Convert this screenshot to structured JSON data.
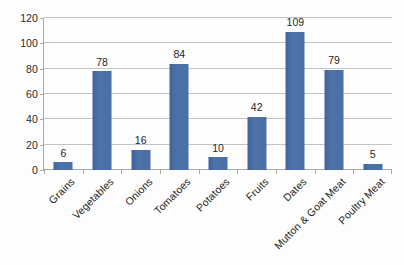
{
  "chart_data": {
    "type": "bar",
    "title": "",
    "subtitle": "",
    "xlabel": "",
    "ylabel": "",
    "categories": [
      "Grains",
      "Vegetables",
      "Onions",
      "Tomatoes",
      "Potatoes",
      "Fruits",
      "Dates",
      "Mutton & Goat Meat",
      "Poultry Meat"
    ],
    "values": [
      6,
      78,
      16,
      84,
      10,
      42,
      109,
      79,
      5
    ],
    "data_labels": [
      "6",
      "78",
      "16",
      "84",
      "10",
      "42",
      "109",
      "79",
      "5"
    ],
    "ylim": [
      0,
      120
    ],
    "ytick_values": [
      0,
      20,
      40,
      60,
      80,
      100,
      120
    ],
    "ytick_labels": [
      "0",
      "20",
      "40",
      "60",
      "80",
      "100",
      "120"
    ],
    "grid": "horizontal",
    "legend": "none",
    "series": [
      {
        "name": "",
        "values": [
          6,
          78,
          16,
          84,
          10,
          42,
          109,
          79,
          5
        ]
      }
    ]
  },
  "style": {
    "bar_color": "#4a6fa5",
    "gridline_color": "#c3c3c3",
    "axis_color": "#a8a8a8",
    "text_color": "#262626",
    "background_color": "#fdfdfd"
  }
}
